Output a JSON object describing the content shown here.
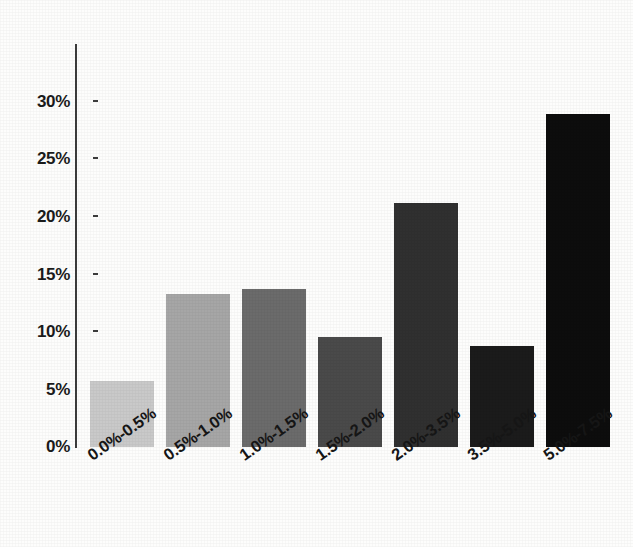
{
  "chart_data": {
    "type": "bar",
    "title": "",
    "subtitle": "",
    "xlabel": "",
    "ylabel": "",
    "categories": [
      "0.0%-0.5%",
      "0.5%-1.0%",
      "1.0%-1.5%",
      "1.5%-2.0%",
      "2.0%-3.5%",
      "3.5%-5.0%",
      "5.0%-7.5%"
    ],
    "values": [
      5.7,
      13.3,
      13.7,
      9.6,
      21.2,
      8.8,
      29.0
    ],
    "value_labels": [
      "5.7%",
      "13.3%",
      "13.7%",
      "9.6%",
      "21.2%",
      "8.8%",
      "29.0%"
    ],
    "bar_colors": [
      "#c9c9c9",
      "#a6a6a6",
      "#6b6b6b",
      "#4a4a4a",
      "#303030",
      "#1b1b1b",
      "#0d0d0d"
    ],
    "ylim": [
      0,
      30
    ],
    "ytick_values": [
      0,
      5,
      10,
      15,
      20,
      25,
      30
    ],
    "ytick_labels": [
      "0%",
      "5%",
      "10%",
      "15%",
      "20%",
      "25%",
      "30%"
    ],
    "grid": false,
    "legend": null,
    "legend_position": "none",
    "xtick_rotation": -35,
    "axis_color": "#3c3c3c",
    "background_color": "#fdfdfc"
  }
}
